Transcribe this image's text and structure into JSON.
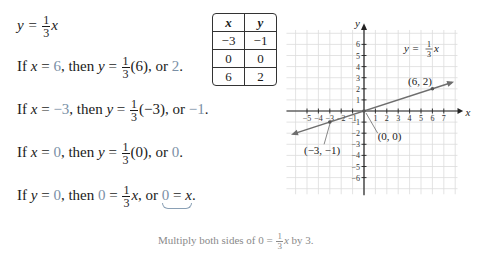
{
  "equation": {
    "lhs": "y =",
    "frac_num": "1",
    "frac_den": "3",
    "var": "x"
  },
  "steps": [
    {
      "if": "If",
      "v1": "x",
      "eq": "=",
      "val": "6",
      "then": ", then",
      "v2": "y",
      "eq2": "=",
      "frac_num": "1",
      "frac_den": "3",
      "arg": "(6)",
      "or": ", or",
      "result": "2",
      "end": "."
    },
    {
      "if": "If",
      "v1": "x",
      "eq": "=",
      "val": "−3",
      "then": ", then",
      "v2": "y",
      "eq2": "=",
      "frac_num": "1",
      "frac_den": "3",
      "arg": "(−3)",
      "or": ", or",
      "result": "−1",
      "end": "."
    },
    {
      "if": "If",
      "v1": "x",
      "eq": "=",
      "val": "0",
      "then": ", then",
      "v2": "y",
      "eq2": "=",
      "frac_num": "1",
      "frac_den": "3",
      "arg": "(0)",
      "or": ", or",
      "result": "0",
      "end": "."
    },
    {
      "if": "If",
      "v1": "y",
      "eq": "=",
      "val": "0",
      "then": ", then",
      "lhs0": "0",
      "eq2": "=",
      "frac_num": "1",
      "frac_den": "3",
      "var": "x",
      "or": ", or",
      "result_lhs": "0",
      "result_eq": "=",
      "result_var": "x",
      "end": "."
    }
  ],
  "table": {
    "headers": [
      "x",
      "y"
    ],
    "rows": [
      [
        "−3",
        "−1"
      ],
      [
        "0",
        "0"
      ],
      [
        "6",
        "2"
      ]
    ]
  },
  "caption": {
    "pre": "Multiply both sides of 0 =",
    "frac_num": "1",
    "frac_den": "3",
    "var": "x",
    "post": "by 3."
  },
  "graph": {
    "x_label": "x",
    "y_label": "y",
    "equation_label": {
      "lhs": "y =",
      "frac_num": "1",
      "frac_den": "3",
      "var": "x"
    },
    "x_ticks": [
      "−5",
      "−4",
      "−3",
      "−2",
      "−1",
      "1",
      "2",
      "3",
      "4",
      "5",
      "6",
      "7"
    ],
    "y_ticks": [
      "6",
      "5",
      "4",
      "3",
      "2",
      "1",
      "−1",
      "−2",
      "−3",
      "−4",
      "−5",
      "−6"
    ],
    "points": [
      {
        "label": "(6, 2)",
        "x": 6,
        "y": 2
      },
      {
        "label": "(0, 0)",
        "x": 0,
        "y": 0
      },
      {
        "label": "(−3, −1)",
        "x": -3,
        "y": -1
      }
    ],
    "line_color": "#6e6e6e",
    "grid_color": "#d9d9d9"
  }
}
